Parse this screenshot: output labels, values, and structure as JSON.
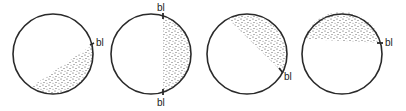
{
  "diagram": {
    "colors": {
      "outline": "#2a2a2a",
      "stipple": "#3a3a3a",
      "background": "#ffffff"
    },
    "panels": [
      {
        "id": "panel-1",
        "circle": {
          "cx": 53,
          "cy": 54,
          "r": 40
        },
        "shaded_region": "lower-right",
        "chord": [
          [
            31,
            87
          ],
          [
            92,
            45
          ]
        ],
        "labels": [
          {
            "text": "bl",
            "x": 96,
            "y": 46
          }
        ]
      },
      {
        "id": "panel-2",
        "circle": {
          "cx": 151,
          "cy": 54,
          "r": 40
        },
        "shaded_region": "right",
        "chord": [
          [
            163,
            16
          ],
          [
            163,
            92
          ]
        ],
        "labels": [
          {
            "text": "bl",
            "x": 157,
            "y": 11
          },
          {
            "text": "bl",
            "x": 157,
            "y": 106
          }
        ]
      },
      {
        "id": "panel-3",
        "circle": {
          "cx": 247,
          "cy": 54,
          "r": 40
        },
        "shaded_region": "upper-right",
        "chord": [
          [
            228,
            19
          ],
          [
            282,
            72
          ]
        ],
        "labels": [
          {
            "text": "bl",
            "x": 284,
            "y": 80
          }
        ]
      },
      {
        "id": "panel-4",
        "circle": {
          "cx": 342,
          "cy": 54,
          "r": 40
        },
        "shaded_region": "top",
        "chord": [
          [
            304,
            39
          ],
          [
            381,
            43
          ]
        ],
        "labels": [
          {
            "text": "bl",
            "x": 385,
            "y": 46
          }
        ]
      }
    ]
  }
}
